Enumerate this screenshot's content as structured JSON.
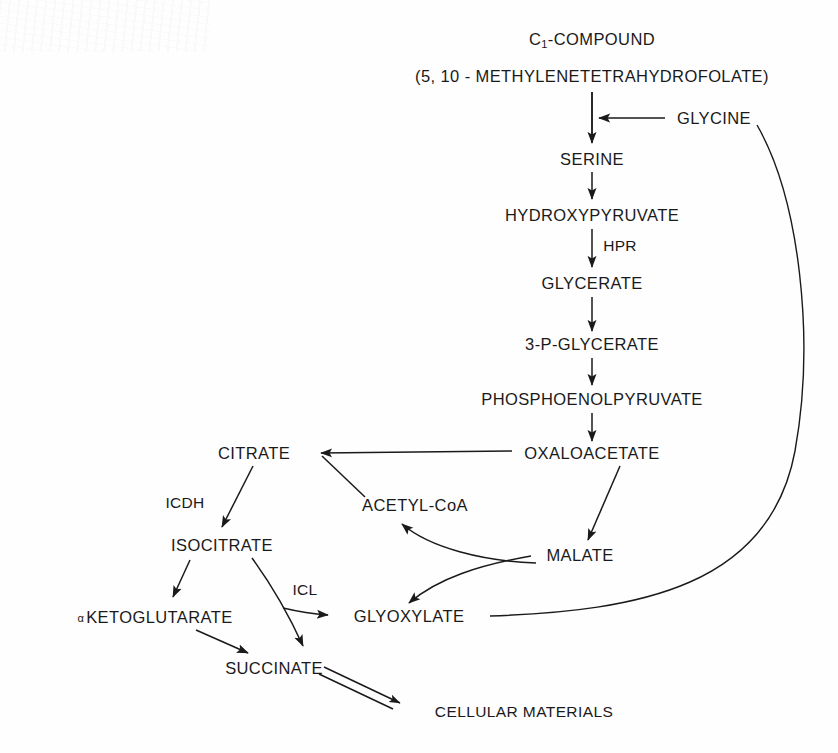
{
  "diagram": {
    "background_color": "#fefefe",
    "ink_color": "#1a1a1a",
    "width": 838,
    "height": 753,
    "nodes": {
      "c1_compound": "C₁-COMPOUND",
      "c1_compound_text": "C",
      "c1_compound_sub": "1",
      "c1_compound_rest": "-COMPOUND",
      "methylene_thf": "(5, 10 - METHYLENETETRAHYDROFOLATE)",
      "glycine": "GLYCINE",
      "serine": "SERINE",
      "hydroxypyruvate": "HYDROXYPYRUVATE",
      "glycerate": "GLYCERATE",
      "three_p_glycerate": "3-P-GLYCERATE",
      "phosphoenolpyruvate": "PHOSPHOENOLPYRUVATE",
      "oxaloacetate": "OXALOACETATE",
      "citrate": "CITRATE",
      "acetyl_coa": "ACETYL-CoA",
      "isocitrate": "ISOCITRATE",
      "malate": "MALATE",
      "alpha_symbol": "α",
      "ketoglutarate": "KETOGLUTARATE",
      "glyoxylate": "GLYOXYLATE",
      "succinate": "SUCCINATE",
      "cellular_materials": "CELLULAR MATERIALS"
    },
    "enzymes": {
      "hpr": "HPR",
      "icdh": "ICDH",
      "icl": "ICL"
    },
    "edges": [
      {
        "from": "methylene_thf",
        "to": "serine",
        "kind": "arrow-down"
      },
      {
        "from": "glycine",
        "to": "serine_branch",
        "kind": "arrow-left"
      },
      {
        "from": "serine",
        "to": "hydroxypyruvate",
        "kind": "arrow-down"
      },
      {
        "from": "hydroxypyruvate",
        "to": "glycerate",
        "kind": "arrow-down",
        "enzyme": "HPR"
      },
      {
        "from": "glycerate",
        "to": "three_p_glycerate",
        "kind": "arrow-down"
      },
      {
        "from": "three_p_glycerate",
        "to": "phosphoenolpyruvate",
        "kind": "arrow-down"
      },
      {
        "from": "phosphoenolpyruvate",
        "to": "oxaloacetate",
        "kind": "arrow-down"
      },
      {
        "from": "oxaloacetate",
        "to": "citrate",
        "kind": "arrow-left"
      },
      {
        "from": "acetyl_coa",
        "to": "citrate",
        "kind": "arrow-diagonal"
      },
      {
        "from": "citrate",
        "to": "isocitrate",
        "kind": "arrow-diagonal",
        "enzyme": "ICDH"
      },
      {
        "from": "oxaloacetate",
        "to": "malate",
        "kind": "arrow-diagonal"
      },
      {
        "from": "malate",
        "to": "glyoxylate",
        "kind": "arrow-curve"
      },
      {
        "from": "glyoxylate",
        "to": "acetyl_coa",
        "kind": "arrow-curve"
      },
      {
        "from": "isocitrate",
        "to": "ketoglutarate",
        "kind": "arrow-diagonal"
      },
      {
        "from": "isocitrate",
        "to": "glyoxylate",
        "kind": "arrow-curve",
        "enzyme": "ICL"
      },
      {
        "from": "isocitrate",
        "to": "succinate",
        "kind": "arrow-curve"
      },
      {
        "from": "ketoglutarate",
        "to": "succinate",
        "kind": "arrow-diagonal"
      },
      {
        "from": "glyoxylate",
        "to": "glycine",
        "kind": "arrow-long-curve"
      },
      {
        "from": "succinate",
        "to": "cellular_materials",
        "kind": "double-arrow"
      }
    ]
  }
}
